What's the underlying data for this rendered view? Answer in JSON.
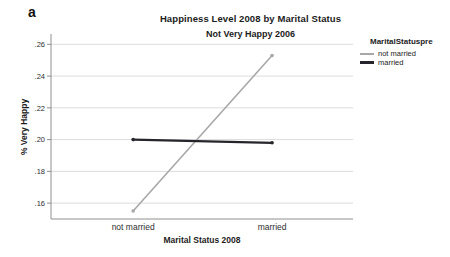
{
  "panel_label": "a",
  "legend": {
    "title": "MaritalStatuspre",
    "items": [
      {
        "label": "not married",
        "color": "#a8a8a8",
        "thickness": 2
      },
      {
        "label": "married",
        "color": "#25252b",
        "thickness": 3
      }
    ]
  },
  "chart_data": {
    "type": "line",
    "title": "Happiness Level 2008 by Marital Status",
    "subtitle": "Not Very Happy 2006",
    "xlabel": "Marital Status 2008",
    "ylabel": "% Very Happy",
    "categories": [
      "not married",
      "married"
    ],
    "series": [
      {
        "name": "not married",
        "values": [
          0.155,
          0.253
        ],
        "color": "#a8a8a8"
      },
      {
        "name": "married",
        "values": [
          0.2,
          0.198
        ],
        "color": "#25252b"
      }
    ],
    "yticks": [
      0.16,
      0.18,
      0.2,
      0.22,
      0.24,
      0.26
    ],
    "ytick_labels": [
      ".16",
      ".18",
      ".20",
      ".22",
      ".24",
      ".26"
    ],
    "ylim": [
      0.15,
      0.2665
    ],
    "grid": true,
    "legend_position": "right",
    "legend_title": "MaritalStatuspre"
  }
}
